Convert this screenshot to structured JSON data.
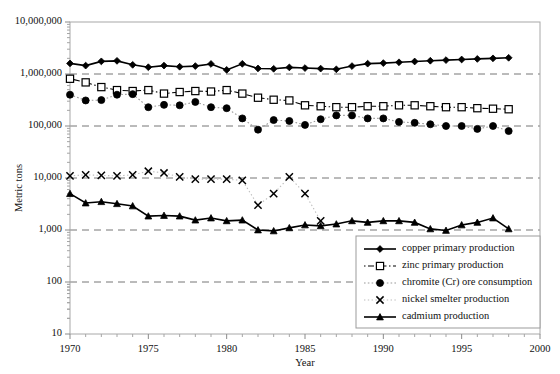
{
  "chart_data": {
    "type": "line",
    "title": "",
    "xlabel": "Year",
    "ylabel": "Metric tons",
    "xlim": [
      1970,
      2000
    ],
    "ylim": [
      10,
      10000000
    ],
    "yscale": "log",
    "grid": "horizontal-dashed",
    "legend_position": "bottom-right-inside",
    "xticks": [
      "1970",
      "1975",
      "1980",
      "1985",
      "1990",
      "1995",
      "2000"
    ],
    "xtick_values": [
      1970,
      1975,
      1980,
      1985,
      1990,
      1995,
      2000
    ],
    "yticks": [
      "10",
      "100",
      "1,000",
      "10,000",
      "100,000",
      "1,000,000",
      "10,000,000"
    ],
    "ytick_values": [
      10,
      100,
      1000,
      10000,
      100000,
      1000000,
      10000000
    ],
    "series": [
      {
        "name": "copper primary production",
        "marker": "filled-diamond",
        "line": "solid-black",
        "x": [
          1970,
          1971,
          1972,
          1973,
          1974,
          1975,
          1976,
          1977,
          1978,
          1979,
          1980,
          1981,
          1982,
          1983,
          1984,
          1985,
          1986,
          1987,
          1988,
          1989,
          1990,
          1991,
          1992,
          1993,
          1994,
          1995,
          1996,
          1997,
          1998
        ],
        "values": [
          1600000,
          1450000,
          1750000,
          1790000,
          1500000,
          1350000,
          1450000,
          1380000,
          1420000,
          1560000,
          1200000,
          1570000,
          1280000,
          1260000,
          1340000,
          1300000,
          1270000,
          1230000,
          1420000,
          1580000,
          1620000,
          1680000,
          1740000,
          1800000,
          1850000,
          1900000,
          1950000,
          2000000,
          2050000
        ]
      },
      {
        "name": "zinc primary production",
        "marker": "open-square",
        "line": "dash-dot-black",
        "x": [
          1970,
          1971,
          1972,
          1973,
          1974,
          1975,
          1976,
          1977,
          1978,
          1979,
          1980,
          1981,
          1982,
          1983,
          1984,
          1985,
          1986,
          1987,
          1988,
          1989,
          1990,
          1991,
          1992,
          1993,
          1994,
          1995,
          1996,
          1997,
          1998
        ],
        "values": [
          810000,
          690000,
          560000,
          490000,
          470000,
          490000,
          420000,
          450000,
          470000,
          460000,
          490000,
          420000,
          350000,
          320000,
          310000,
          250000,
          240000,
          230000,
          230000,
          240000,
          240000,
          250000,
          250000,
          240000,
          230000,
          230000,
          220000,
          215000,
          210000
        ]
      },
      {
        "name": "chromite (Cr) ore consumption",
        "marker": "filled-circle",
        "line": "dotted-gray",
        "x": [
          1970,
          1971,
          1972,
          1973,
          1974,
          1975,
          1976,
          1977,
          1978,
          1979,
          1980,
          1981,
          1982,
          1983,
          1984,
          1985,
          1986,
          1987,
          1988,
          1989,
          1990,
          1991,
          1992,
          1993,
          1994,
          1995,
          1996,
          1997,
          1998
        ],
        "values": [
          400000,
          310000,
          315000,
          400000,
          410000,
          230000,
          255000,
          250000,
          290000,
          230000,
          220000,
          140000,
          85000,
          130000,
          125000,
          105000,
          135000,
          160000,
          160000,
          140000,
          140000,
          120000,
          115000,
          108000,
          100000,
          100000,
          88000,
          100000,
          80000
        ]
      },
      {
        "name": "nickel smelter production",
        "marker": "x-cross",
        "line": "dotted-light",
        "x": [
          1970,
          1971,
          1972,
          1973,
          1974,
          1975,
          1976,
          1977,
          1978,
          1979,
          1980,
          1981,
          1982,
          1983,
          1984,
          1985,
          1986
        ],
        "values": [
          11000,
          11500,
          11200,
          11000,
          11500,
          13500,
          12500,
          10500,
          9500,
          9500,
          9500,
          9000,
          3000,
          5000,
          10500,
          5000,
          1500
        ]
      },
      {
        "name": "cadmium production",
        "marker": "filled-triangle",
        "line": "solid-black",
        "x": [
          1970,
          1971,
          1972,
          1973,
          1974,
          1975,
          1976,
          1977,
          1978,
          1979,
          1980,
          1981,
          1982,
          1983,
          1984,
          1985,
          1986,
          1987,
          1988,
          1989,
          1990,
          1991,
          1992,
          1993,
          1994,
          1995,
          1996,
          1997,
          1998
        ],
        "values": [
          5000,
          3300,
          3500,
          3200,
          2900,
          1850,
          1900,
          1850,
          1550,
          1700,
          1500,
          1550,
          1000,
          960,
          1100,
          1250,
          1200,
          1300,
          1500,
          1400,
          1500,
          1500,
          1400,
          1050,
          980,
          1250,
          1400,
          1700,
          1050
        ]
      }
    ]
  },
  "axes": {
    "ylabel": "Metric tons",
    "xlabel": "Year"
  }
}
